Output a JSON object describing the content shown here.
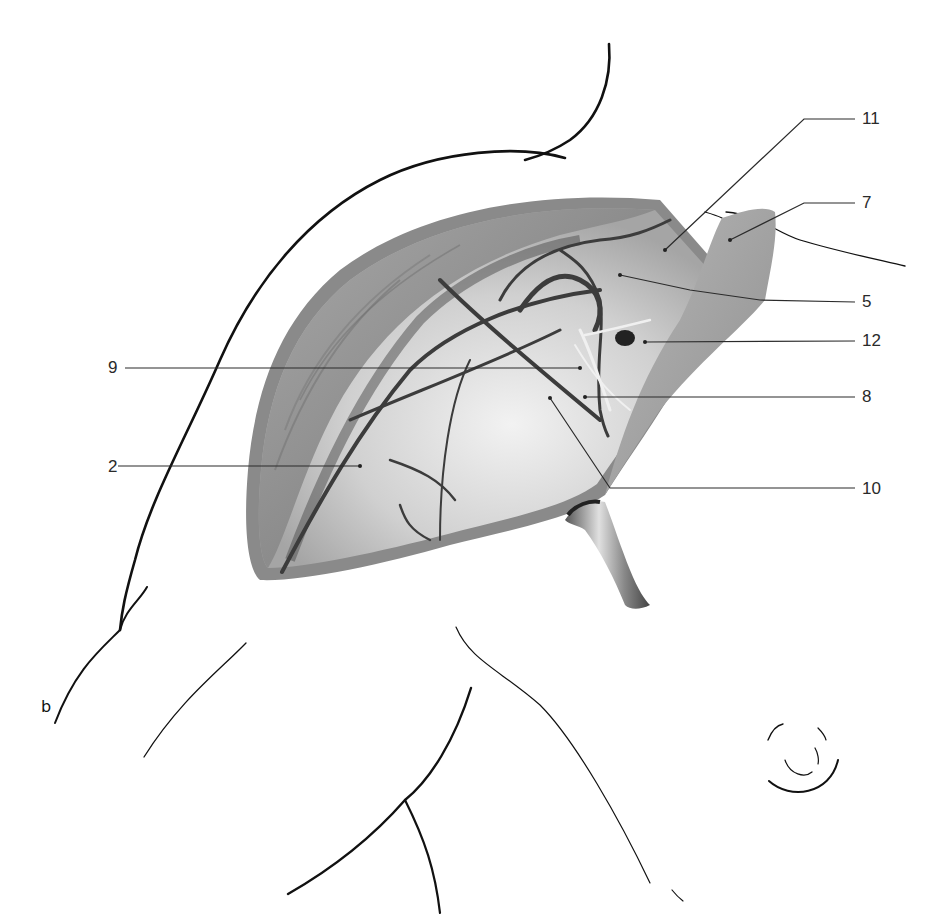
{
  "figure": {
    "panel_label": "b",
    "colors": {
      "background": "#ffffff",
      "outline": "#111111",
      "wound_rim": "#8a8a8a",
      "muscle": "#9a9a9a",
      "vessel": "#3c3c3c",
      "nerve": "#eeeeee",
      "fascia": "#d8d8d8",
      "leader_line": "#2b2b2b"
    },
    "labels": [
      {
        "id": "11",
        "text": "11",
        "x": 862,
        "y": 124
      },
      {
        "id": "7",
        "text": "7",
        "x": 862,
        "y": 208
      },
      {
        "id": "5",
        "text": "5",
        "x": 862,
        "y": 307
      },
      {
        "id": "12",
        "text": "12",
        "x": 862,
        "y": 346
      },
      {
        "id": "9",
        "text": "9",
        "x": 108,
        "y": 372
      },
      {
        "id": "8",
        "text": "8",
        "x": 862,
        "y": 402
      },
      {
        "id": "2",
        "text": "2",
        "x": 108,
        "y": 471
      },
      {
        "id": "10",
        "text": "10",
        "x": 862,
        "y": 493
      }
    ],
    "icons": {
      "retractor": "retractor-icon",
      "nipple": "nipple-icon"
    }
  }
}
